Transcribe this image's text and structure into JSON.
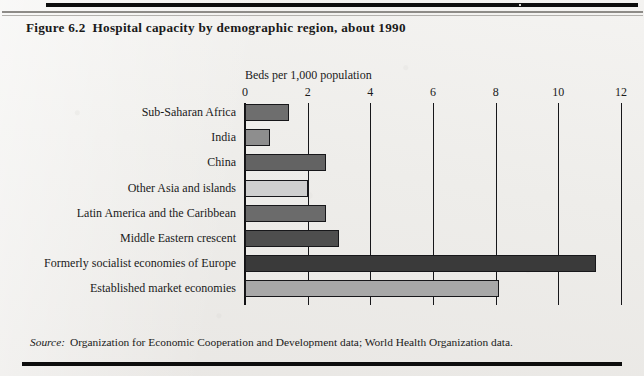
{
  "page": {
    "figure_number": "Figure 6.2",
    "title": "Hospital capacity by demographic region, about 1990",
    "source_word": "Source:",
    "source_text": "Organization for Economic Cooperation and Development data; World Health Organization data."
  },
  "chart_data": {
    "type": "bar",
    "orientation": "horizontal",
    "title": "Hospital capacity by demographic region, about 1990",
    "xlabel": "Beds per 1,000 population",
    "ylabel": "",
    "xlim": [
      0,
      12
    ],
    "xticks": [
      0,
      2,
      4,
      6,
      8,
      10,
      12
    ],
    "xtick_labels": [
      "0",
      "2",
      "4",
      "6",
      "8",
      "10",
      "12"
    ],
    "grid": true,
    "legend": false,
    "categories": [
      "Sub-Saharan Africa",
      "India",
      "China",
      "Other Asia and islands",
      "Latin America and the Caribbean",
      "Middle Eastern crescent",
      "Formerly socialist economies of Europe",
      "Established market economies"
    ],
    "values": [
      1.4,
      0.8,
      2.6,
      2.0,
      2.6,
      3.0,
      11.2,
      8.1
    ],
    "bar_colors": [
      "#6e6e6e",
      "#8e8e8e",
      "#636363",
      "#cfcfcf",
      "#6b6b6b",
      "#4e4e4e",
      "#3a3a3a",
      "#a8a8a8"
    ],
    "bars": [
      {
        "label": "Sub-Saharan Africa",
        "value": 1.4,
        "color": "#6e6e6e"
      },
      {
        "label": "India",
        "value": 0.8,
        "color": "#8e8e8e"
      },
      {
        "label": "China",
        "value": 2.6,
        "color": "#636363"
      },
      {
        "label": "Other Asia and islands",
        "value": 2.0,
        "color": "#cfcfcf"
      },
      {
        "label": "Latin America and the Caribbean",
        "value": 2.6,
        "color": "#6b6b6b"
      },
      {
        "label": "Middle Eastern crescent",
        "value": 3.0,
        "color": "#4e4e4e"
      },
      {
        "label": "Formerly socialist economies of Europe",
        "value": 11.2,
        "color": "#3a3a3a"
      },
      {
        "label": "Established market economies",
        "value": 8.1,
        "color": "#a8a8a8"
      }
    ]
  }
}
